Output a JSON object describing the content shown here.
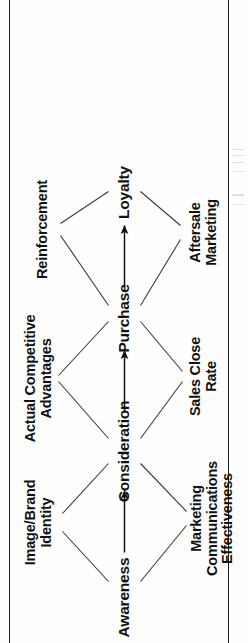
{
  "page": {
    "orientation": "rotated-90-ccw",
    "background_color": "#fefefe",
    "ink_color": "#111111",
    "border_rule_color": "#1a1a1a"
  },
  "diagram": {
    "type": "flow-chain-with-drivers",
    "stages": [
      {
        "id": "awareness",
        "label": "Awareness"
      },
      {
        "id": "consideration",
        "label": "Consideration"
      },
      {
        "id": "purchase",
        "label": "Purchase"
      },
      {
        "id": "loyalty",
        "label": "Loyalty"
      }
    ],
    "drivers_top": [
      {
        "id": "image-brand-identity",
        "label": "Image/Brand\nIdentity"
      },
      {
        "id": "actual-competitive-adv",
        "label": "Actual Competitive\nAdvantages"
      },
      {
        "id": "reinforcement",
        "label": "Reinforcement"
      }
    ],
    "drivers_bottom": [
      {
        "id": "marketing-comms-effectiveness",
        "label": "Marketing\nCommunications\nEffectiveness"
      },
      {
        "id": "sales-close-rate",
        "label": "Sales Close\nRate"
      },
      {
        "id": "aftersale-marketing",
        "label": "Aftersale\nMarketing"
      }
    ],
    "flow_arrows": [
      {
        "from": "awareness",
        "to": "consideration"
      },
      {
        "from": "consideration",
        "to": "purchase"
      },
      {
        "from": "purchase",
        "to": "loyalty"
      }
    ],
    "driver_links": [
      {
        "from": "awareness",
        "to": "image-brand-identity"
      },
      {
        "from": "consideration",
        "to": "image-brand-identity"
      },
      {
        "from": "awareness",
        "to": "marketing-comms-effectiveness"
      },
      {
        "from": "consideration",
        "to": "marketing-comms-effectiveness"
      },
      {
        "from": "consideration",
        "to": "actual-competitive-adv"
      },
      {
        "from": "purchase",
        "to": "actual-competitive-adv"
      },
      {
        "from": "consideration",
        "to": "sales-close-rate"
      },
      {
        "from": "purchase",
        "to": "sales-close-rate"
      },
      {
        "from": "purchase",
        "to": "reinforcement"
      },
      {
        "from": "loyalty",
        "to": "reinforcement"
      },
      {
        "from": "purchase",
        "to": "aftersale-marketing"
      },
      {
        "from": "loyalty",
        "to": "aftersale-marketing"
      }
    ]
  }
}
